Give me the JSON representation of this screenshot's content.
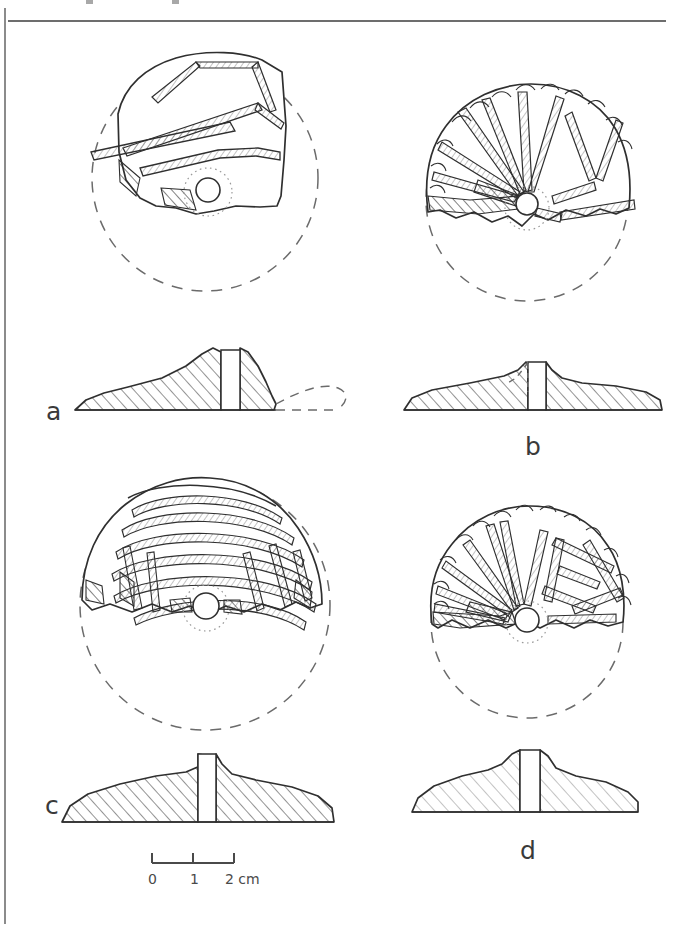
{
  "page": {
    "kind": "archaeological-illustration-plate",
    "background": "#ffffff",
    "ink": "#2b2b2b",
    "width": 695,
    "height": 926,
    "rules": {
      "top_horizontal_rule": true,
      "left_vertical_rule": true
    }
  },
  "figure": {
    "caption_fragment_above_rule": "",
    "objects": [
      {
        "id": "a",
        "label": "a",
        "plan": {
          "reconstruction": "dashed-circle",
          "preserved": "upper-left-fragment",
          "decoration": "broad incised bands and oblique grooves",
          "perforation": "central circular hole with dotted ring"
        },
        "section": {
          "hatching": "diagonal",
          "profile": "asymmetric domed cone with flaring flange",
          "reconstruction": "dashed on right side",
          "perforation": "central vertical channel"
        }
      },
      {
        "id": "b",
        "label": "b",
        "plan": {
          "reconstruction": "dashed-circle",
          "preserved": "upper-half-fragment",
          "decoration": "radiating incised rays and chevrons from centre",
          "rim": "scalloped / notched edge",
          "perforation": "central circular hole with dotted ring"
        },
        "section": {
          "hatching": "diagonal",
          "profile": "low flat disc with raised central boss",
          "reconstruction": "dashed boss outline on left",
          "perforation": "central vertical channel"
        }
      },
      {
        "id": "c",
        "label": "c",
        "plan": {
          "reconstruction": "dashed-circle",
          "preserved": "upper-half-fragment",
          "decoration": "concentric arc grooves with radial strokes",
          "perforation": "central circular hole with dotted ring"
        },
        "section": {
          "hatching": "diagonal",
          "profile": "wide flat disc with low central dome",
          "perforation": "central vertical channel"
        }
      },
      {
        "id": "d",
        "label": "d",
        "plan": {
          "reconstruction": "dashed-circle",
          "preserved": "upper-half-fragment",
          "decoration": "radiating rays with nested V and chevron motifs",
          "rim": "scalloped / notched edge",
          "perforation": "central circular hole with dotted ring"
        },
        "section": {
          "hatching": "sparse diagonal",
          "profile": "low lenticular disc with central boss",
          "perforation": "central vertical channel"
        }
      }
    ]
  },
  "scale_bar": {
    "unit": "cm",
    "length_cm": 2,
    "ticks": [
      "0",
      "1",
      "2 cm"
    ],
    "tick_labels": {
      "zero": "0",
      "one": "1",
      "two": "2 cm"
    }
  }
}
